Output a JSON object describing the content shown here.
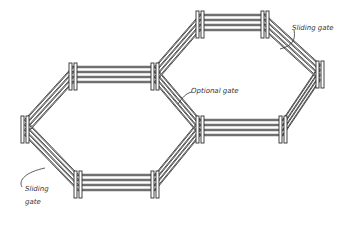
{
  "diagram": {
    "colors": {
      "line": "#333333",
      "background": "#ffffff"
    },
    "labels": {
      "sliding_gate_top": "Sliding gate",
      "optional_gate": "Optional gate",
      "sliding_gate_bottom_line1": "Sliding",
      "sliding_gate_bottom_line2": "gate"
    },
    "pens": [
      {
        "name": "left-hexagon",
        "vertices": [
          [
            73,
            72
          ],
          [
            155,
            72
          ],
          [
            200,
            125
          ],
          [
            155,
            180
          ],
          [
            78,
            180
          ],
          [
            25,
            125
          ]
        ]
      },
      {
        "name": "right-hexagon",
        "vertices": [
          [
            200,
            20
          ],
          [
            265,
            20
          ],
          [
            320,
            70
          ],
          [
            283,
            125
          ],
          [
            200,
            125
          ],
          [
            155,
            72
          ]
        ]
      }
    ]
  }
}
